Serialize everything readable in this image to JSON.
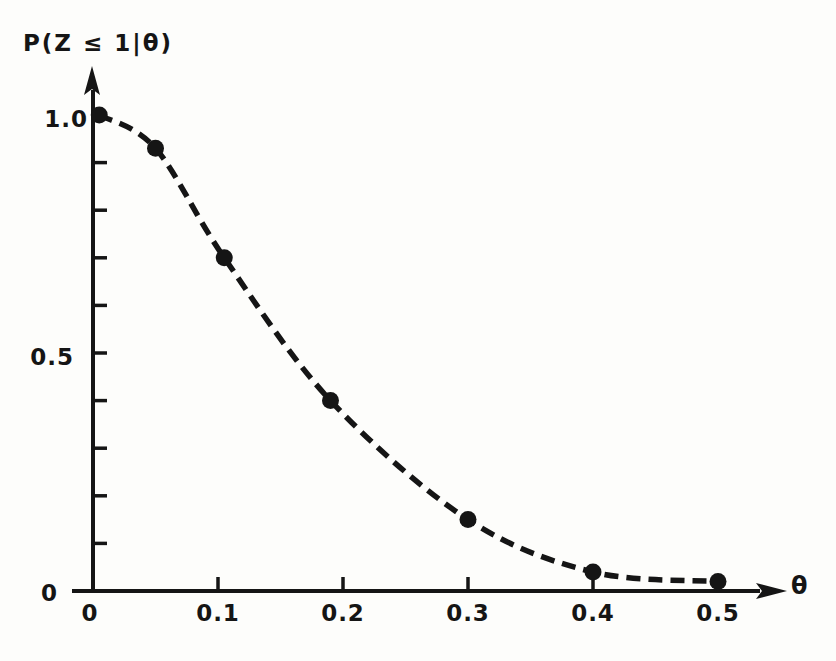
{
  "figure": {
    "background": "#fdfdfb",
    "ink_color": "#151515"
  },
  "chart_data": {
    "type": "line",
    "title": "",
    "ylabel": "P(Z ≤ 1|θ)",
    "xlabel": "θ",
    "line_style": "dashed",
    "marker": "filled-circle",
    "grid": false,
    "legend": null,
    "xlim": [
      0,
      0.55
    ],
    "ylim": [
      0,
      1.08
    ],
    "x": [
      0.005,
      0.05,
      0.105,
      0.19,
      0.3,
      0.4,
      0.5
    ],
    "y": [
      1.0,
      0.93,
      0.7,
      0.4,
      0.15,
      0.04,
      0.02
    ],
    "x_ticks": [
      {
        "v": 0.1,
        "label": "0.1"
      },
      {
        "v": 0.2,
        "label": "0.2"
      },
      {
        "v": 0.3,
        "label": "0.3"
      },
      {
        "v": 0.4,
        "label": "0.4"
      },
      {
        "v": 0.5,
        "label": "0.5"
      }
    ],
    "y_ticks": [
      {
        "v": 0.1
      },
      {
        "v": 0.2
      },
      {
        "v": 0.3
      },
      {
        "v": 0.4
      },
      {
        "v": 0.5,
        "label": "0.5"
      },
      {
        "v": 0.6
      },
      {
        "v": 0.7
      },
      {
        "v": 0.8
      },
      {
        "v": 0.9
      },
      {
        "v": 1.0,
        "label": "1.0"
      }
    ],
    "x_origin_label": "0",
    "y_origin_label": "0"
  }
}
